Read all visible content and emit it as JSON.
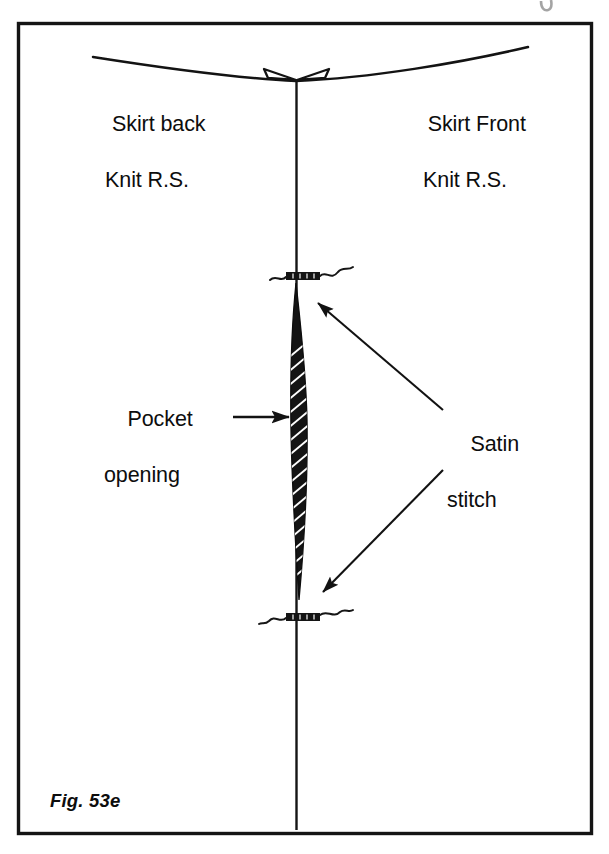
{
  "figure": {
    "caption": "Fig. 53e",
    "type": "sewing-pattern-diagram",
    "border_color": "#111111",
    "ink_color": "#0d0d0d",
    "background_color": "#ffffff"
  },
  "labels": {
    "skirt_back": {
      "line1": "Skirt back",
      "line2": "Knit R.S."
    },
    "skirt_front": {
      "line1": "Skirt Front",
      "line2": "Knit R.S."
    },
    "pocket": {
      "line1": "Pocket",
      "line2": "opening"
    },
    "satin": {
      "line1": "Satin",
      "line2": "stitch"
    }
  },
  "parts": {
    "center_seam": "center-vertical-seam-line",
    "hem_curve": "curved-hem-edge",
    "apex_flaps": "seam-allowance-flaps",
    "pocket_shape": "hatched-pocket-opening",
    "bartack_top": "satin-stitch-bartack-top",
    "bartack_bottom": "satin-stitch-bartack-bottom"
  },
  "callouts": {
    "pocket_arrow": "arrow-pointing-right-to-pocket",
    "satin_arrow_top": "arrow-pointing-upleft-to-top-bartack",
    "satin_arrow_bottom": "arrow-pointing-downleft-to-bottom-bartack"
  }
}
